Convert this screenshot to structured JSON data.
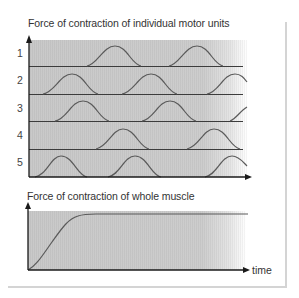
{
  "top_chart": {
    "title": "Force of contraction of individual motor units",
    "rows": [
      {
        "label": "1",
        "peaks_x": [
          115,
          197
        ]
      },
      {
        "label": "2",
        "peaks_x": [
          72,
          151,
          235
        ]
      },
      {
        "label": "3",
        "peaks_x": [
          83,
          170,
          256
        ]
      },
      {
        "label": "4",
        "peaks_x": [
          123,
          214
        ]
      },
      {
        "label": "5",
        "peaks_x": [
          61,
          135,
          232
        ]
      }
    ]
  },
  "bottom_chart": {
    "title": "Force of contraction of whole muscle",
    "x_axis_label": "time"
  },
  "colors": {
    "fill_gray": "#c8c8c8",
    "line": "#555555",
    "axis": "#1a1a1a",
    "border": "#d4d4d4"
  }
}
